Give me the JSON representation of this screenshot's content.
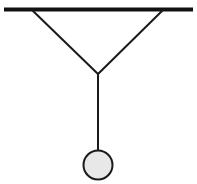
{
  "figure": {
    "type": "line-diagram",
    "background_color": "#ffffff",
    "canvas": {
      "width": 197,
      "height": 184
    }
  },
  "ceiling_bar": {
    "label": "ceiling support bar",
    "color": "#111111",
    "thickness": 4,
    "x1": 4,
    "y1": 9.5,
    "x2": 193,
    "y2": 9.5
  },
  "left_cord": {
    "label": "left diagonal cord",
    "color": "#1a1a1a",
    "thickness": 2,
    "x1": 32,
    "y1": 10,
    "x2": 98,
    "y2": 74
  },
  "right_cord": {
    "label": "right diagonal cord",
    "color": "#1a1a1a",
    "thickness": 2,
    "x1": 163,
    "y1": 10,
    "x2": 98,
    "y2": 74
  },
  "vertical_string": {
    "label": "vertical string",
    "color": "#1a1a1a",
    "thickness": 2,
    "x1": 98,
    "y1": 74,
    "x2": 98,
    "y2": 152
  },
  "junction": {
    "label": "knot junction",
    "x": 98,
    "y": 74
  },
  "ball": {
    "label": "suspended ball",
    "cx": 98,
    "cy": 165,
    "r": 14.5,
    "fill_color": "#e8e8e8",
    "stroke_color": "#1a1a1a",
    "stroke_width": 2
  }
}
